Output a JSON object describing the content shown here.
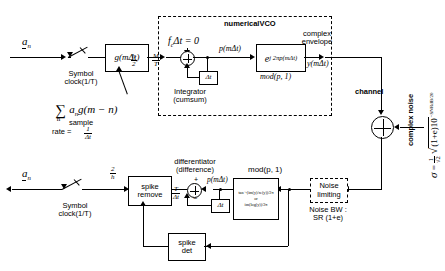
{
  "diagram": {
    "transmitter": {
      "input_label": "a",
      "input_sub": "n",
      "switch_label_line1": "Symbol",
      "switch_label_line2": "clock(1/T)",
      "pulse_block": "g(mΔt)",
      "sum_formula": "∑ a g(m − n)",
      "sum_sigma": "∑",
      "sum_sigma_sub": "n",
      "sum_body_a": "a",
      "sum_body_a_sub": "n",
      "sum_body_rest": "g(m − n)",
      "sample_rate_line1": "sample",
      "sample_rate_line2": "rate =",
      "sample_rate_num": "1",
      "sample_rate_den": "Δt",
      "gain_h2_num": "h",
      "gain_h2_den": "2",
      "gain_mt_num": "M",
      "gain_mt_den": "T"
    },
    "vco": {
      "title": "numericalVCO",
      "offset_label": "f Δt = 0",
      "offset_f": "f",
      "offset_f_sub": "c",
      "offset_rest": "Δt = 0",
      "integrator_line1": "Integrator",
      "integrator_line2": "(cumsum)",
      "delay_label": "Δt",
      "phase_signal": "p(mΔt)",
      "exp_block": "e",
      "exp_superscript": "j 2πp(mΔt)",
      "exp_mod_label": "mod(p, 1)",
      "envelope_line1": "complex",
      "envelope_line2": "envelope",
      "output_signal": "y(mΔt)"
    },
    "channel": {
      "label": "channel",
      "noise_line1": "complex",
      "noise_line2": "noise",
      "sigma_symbol": "σ",
      "sigma_equals": "=",
      "sigma_frac_num": "1",
      "sigma_frac_den": "√2",
      "sigma_sqrt_body": "(1+e)10",
      "sigma_exponent": "−SNRdB/20"
    },
    "receiver": {
      "noise_limiting_line1": "Noise",
      "noise_limiting_line2": "limiting",
      "noise_bw_line1": "Noise BW :",
      "noise_bw_line2": "SR (1+e)",
      "mod_label": "mod(p, 1)",
      "arg_formula_line1": "tan⁻¹(im(y)/re(y))/2π",
      "arg_formula_or": "or",
      "arg_formula_line2": "im(log(y))/2π",
      "differentiator_line1": "differentiator",
      "differentiator_line2": "(difference)",
      "diff_signal": "p(mΔt)",
      "diff_delay_label": "Δt",
      "diff_plus": "+",
      "diff_minus": "−",
      "spike_remove_line1": "spike",
      "spike_remove_line2": "remove",
      "spike_det_line1": "spike",
      "spike_det_line2": "det",
      "gain_tdt_num": "T",
      "gain_tdt_den": "Δt",
      "gain_2h_num": "2",
      "gain_2h_den": "h",
      "out_switch_line1": "Symbol",
      "out_switch_line2": "clock(1/T)",
      "output_label": "a",
      "output_sub": "n"
    }
  }
}
